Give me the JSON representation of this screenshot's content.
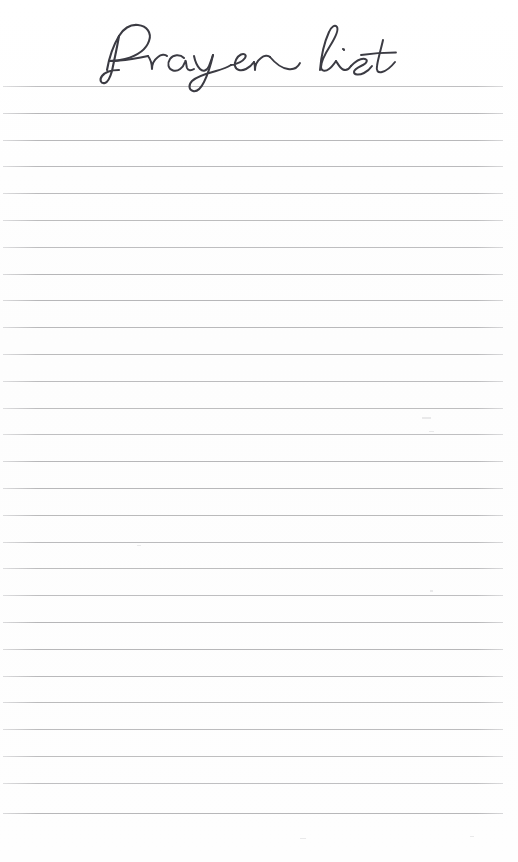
{
  "page": {
    "title": "Prayer list",
    "kind": "printable-lined-notes-page",
    "width": 518,
    "height": 862,
    "background_color": "#fefefe"
  },
  "header": {
    "title": "Prayer list",
    "title_color": "#3b3b43",
    "title_style": "handwritten-script",
    "title_left": 95,
    "title_top": 16,
    "title_width": 320,
    "title_height": 72
  },
  "ruled_area": {
    "line_color": "#b2b2b4",
    "line_thickness": 1,
    "line_left": 3,
    "line_width": 500,
    "line_count": 28,
    "first_line_y": 86,
    "line_pitch": 26.8,
    "last_line_y": 813,
    "lines_y": [
      86,
      113,
      140,
      166,
      193,
      220,
      247,
      274,
      300,
      327,
      354,
      381,
      408,
      434,
      461,
      488,
      515,
      542,
      568,
      595,
      622,
      649,
      676,
      702,
      729,
      756,
      783,
      813
    ]
  },
  "artifacts": {
    "specks": [
      {
        "x": 422,
        "y": 417,
        "w": 9,
        "h": 2
      },
      {
        "x": 429,
        "y": 431,
        "w": 5,
        "h": 1
      },
      {
        "x": 430,
        "y": 590,
        "w": 3,
        "h": 2
      },
      {
        "x": 137,
        "y": 545,
        "w": 4,
        "h": 1
      },
      {
        "x": 300,
        "y": 838,
        "w": 6,
        "h": 1
      },
      {
        "x": 470,
        "y": 836,
        "w": 4,
        "h": 1
      }
    ]
  }
}
